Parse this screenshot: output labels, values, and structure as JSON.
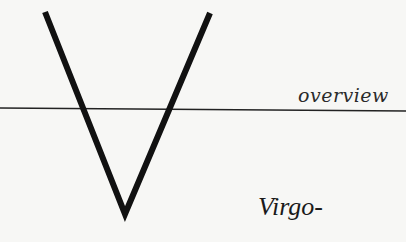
{
  "labels": {
    "top_right": "overview",
    "bottom_right": "Virgo-"
  },
  "graphic": {
    "glyph": "V",
    "stroke_color": "#111111",
    "line_color": "#222222"
  }
}
